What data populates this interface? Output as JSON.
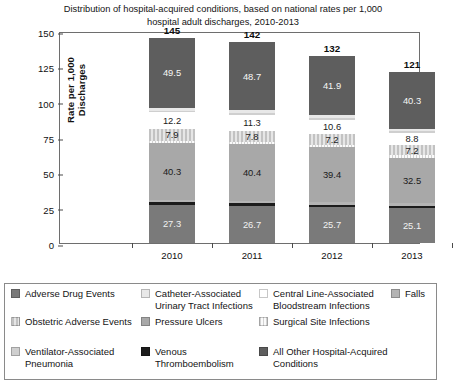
{
  "chart_data": {
    "type": "bar",
    "title": "Distribution of hospital-acquired conditions, based on national rates per 1,000 hospital adult discharges, 2010-2013",
    "title_line1": "Distribution of hospital-acquired conditions, based on national rates per 1,000",
    "title_line2": "hospital adult discharges, 2010-2013",
    "xlabel": "",
    "ylabel": "Rate per 1,000 Discharges",
    "categories": [
      "2010",
      "2011",
      "2012",
      "2013"
    ],
    "ylim": [
      0,
      150
    ],
    "yticks": [
      "0",
      "25",
      "50",
      "75",
      "100",
      "125",
      "150"
    ],
    "grid": false,
    "stacked": true,
    "legend_position": "bottom",
    "totals": [
      "145",
      "142",
      "132",
      "121"
    ],
    "totals_values": [
      145,
      142,
      132,
      121
    ],
    "series": [
      {
        "name": "Adverse Drug Events",
        "key": "ado",
        "color": "#7a7a7a",
        "values": [
          27.3,
          26.7,
          25.7,
          25.1
        ],
        "labels": [
          "27.3",
          "26.7",
          "25.7",
          "25.1"
        ]
      },
      {
        "name": "Venous Thromboembolism",
        "key": "vte",
        "color": "#1c1c1c",
        "values": [
          1.6,
          1.6,
          1.5,
          1.4
        ],
        "labels": [
          "",
          "",
          "",
          ""
        ]
      },
      {
        "name": "Falls",
        "key": "falls",
        "color": "#b4b4b4",
        "values": [
          2.0,
          2.0,
          1.9,
          1.8
        ],
        "labels": [
          "",
          "",
          "",
          ""
        ]
      },
      {
        "name": "Pressure Ulcers",
        "key": "pu",
        "color": "#a8a8a8",
        "values": [
          40.3,
          40.4,
          39.4,
          32.5
        ],
        "labels": [
          "40.3",
          "40.4",
          "39.4",
          "32.5"
        ]
      },
      {
        "name": "Surgical Site Infections",
        "key": "ssi",
        "color": "#ededed",
        "values": [
          1.8,
          1.8,
          1.7,
          1.6
        ],
        "labels": [
          "",
          "",
          "",
          ""
        ]
      },
      {
        "name": "Obstetric Adverse Events",
        "key": "obs",
        "color": "#d8d8d8",
        "values": [
          7.9,
          7.8,
          7.2,
          7.2
        ],
        "labels": [
          "7.9",
          "7.8",
          "7.2",
          "7.2"
        ]
      },
      {
        "name": "Central Line-Associated Bloodstream Infections",
        "key": "clabsi",
        "color": "#ffffff",
        "values": [
          12.2,
          11.3,
          10.6,
          8.8
        ],
        "labels": [
          "12.2",
          "11.3",
          "10.6",
          "8.8"
        ]
      },
      {
        "name": "Ventilator-Associated Pneumonia",
        "key": "vap",
        "color": "#cfcfcf",
        "values": [
          1.2,
          1.2,
          1.1,
          1.0
        ],
        "labels": [
          "",
          "",
          "",
          ""
        ]
      },
      {
        "name": "Catheter-Associated Urinary Tract Infections",
        "key": "cauti",
        "color": "#e8e8e8",
        "values": [
          2.2,
          2.1,
          2.0,
          1.9
        ],
        "labels": [
          "",
          "",
          "",
          ""
        ]
      },
      {
        "name": "All Other Hospital-Acquired Conditions",
        "key": "other",
        "color": "#5e5e5e",
        "values": [
          49.5,
          48.7,
          41.9,
          40.3
        ],
        "labels": [
          "49.5",
          "48.7",
          "41.9",
          "40.3"
        ]
      }
    ]
  },
  "legend": {
    "entries": [
      {
        "label": "Adverse Drug Events",
        "key": "ado"
      },
      {
        "label": "Catheter-Associated Urinary Tract Infections",
        "key": "cauti"
      },
      {
        "label": "Central Line-Associated Bloodstream Infections",
        "key": "clabsi"
      },
      {
        "label": "Falls",
        "key": "falls"
      },
      {
        "label": "Obstetric Adverse Events",
        "key": "obs"
      },
      {
        "label": "Pressure Ulcers",
        "key": "pu"
      },
      {
        "label": "Surgical Site Infections",
        "key": "ssi"
      },
      {
        "label": "Ventilator-Associated Pneumonia",
        "key": "vap"
      },
      {
        "label": "Venous Thromboembolism",
        "key": "vte"
      },
      {
        "label": "All Other Hospital-Acquired Conditions",
        "key": "other"
      }
    ]
  }
}
